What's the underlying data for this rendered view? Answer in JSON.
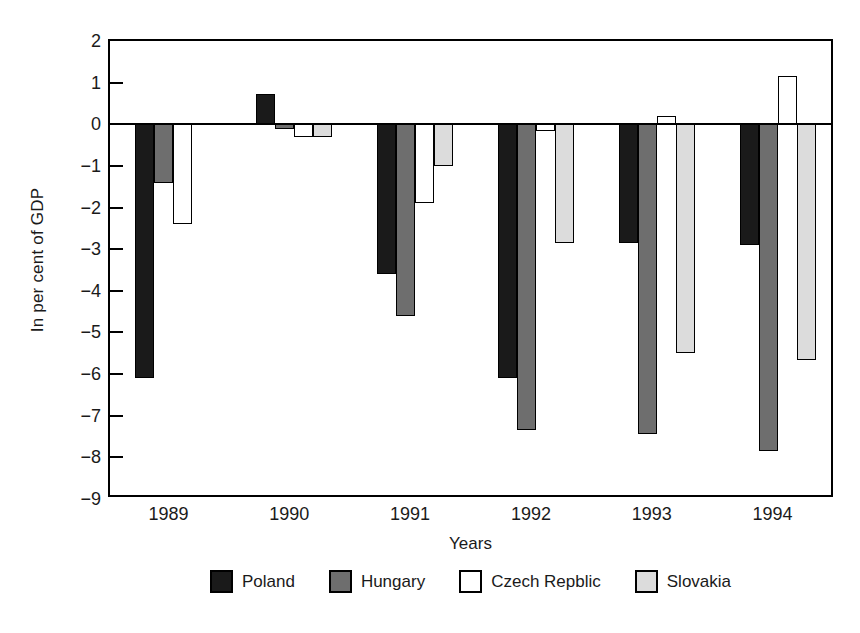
{
  "chart_data": {
    "type": "bar",
    "title": "",
    "xlabel": "Years",
    "ylabel": "In per cent of GDP",
    "categories": [
      "1989",
      "1990",
      "1991",
      "1992",
      "1993",
      "1994"
    ],
    "ylim": [
      -9,
      2
    ],
    "yticks": [
      2,
      1,
      0,
      -1,
      -2,
      -3,
      -4,
      -5,
      -6,
      -7,
      -8,
      -9
    ],
    "ytick_labels": [
      "2",
      "1",
      "0",
      "−1",
      "−2",
      "−3",
      "−4",
      "−5",
      "−6",
      "−7",
      "−8",
      "−9"
    ],
    "grid": false,
    "legend_position": "bottom",
    "series": [
      {
        "name": "Poland",
        "color": "#1a1a1a",
        "swatch": "solid-black",
        "values": [
          -6.1,
          0.72,
          -3.6,
          -6.1,
          -2.85,
          -2.9
        ]
      },
      {
        "name": "Hungary",
        "color": "#6e6e6e",
        "swatch": "dark-gray",
        "values": [
          -1.4,
          -0.12,
          -4.6,
          -7.35,
          -7.45,
          -7.85
        ]
      },
      {
        "name": "Czech Repblic",
        "color": "#ffffff",
        "swatch": "white",
        "values": [
          -2.4,
          -0.3,
          -1.9,
          -0.15,
          0.2,
          1.15
        ]
      },
      {
        "name": "Slovakia",
        "color": "#dcdcdc",
        "swatch": "light-gray",
        "values": [
          null,
          -0.3,
          -1.0,
          -2.85,
          -5.5,
          -5.65
        ]
      }
    ]
  }
}
